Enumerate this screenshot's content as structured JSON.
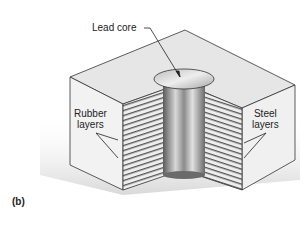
{
  "figure": {
    "part_label": "(b)",
    "labels": {
      "lead_core": "Lead core",
      "rubber_line1": "Rubber",
      "rubber_line2": "layers",
      "steel_line1": "Steel",
      "steel_line2": "layers"
    },
    "colors": {
      "top_face": "#e6e6e6",
      "side_face": "#f2f2f2",
      "layer_stripe": "#555555",
      "core": "#9a9a9a",
      "shadow": "#d8d8d8"
    }
  }
}
